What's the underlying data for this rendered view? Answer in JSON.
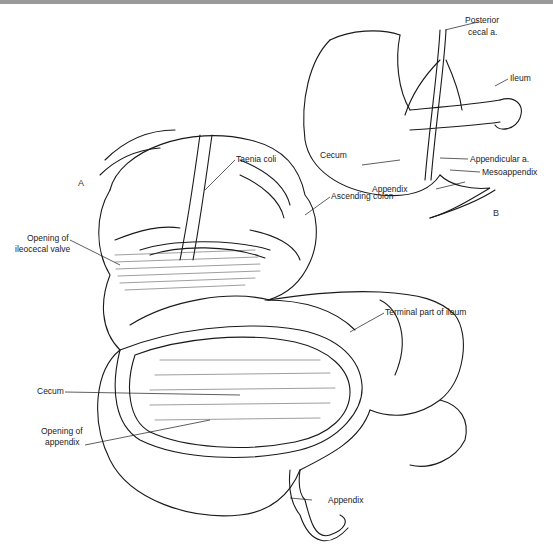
{
  "figure": {
    "panels": [
      {
        "id": "A",
        "label": "A"
      },
      {
        "id": "B",
        "label": "B"
      }
    ],
    "panel_a_labels": {
      "taenia_coli": "Taenia coli",
      "ascending_colon": "Ascending colon",
      "opening_ileocecal_line1": "Opening of",
      "opening_ileocecal_line2": "ileocecal valve",
      "terminal_ileum": "Terminal part of ileum",
      "cecum": "Cecum",
      "opening_appendix_line1": "Opening of",
      "opening_appendix_line2": "appendix",
      "appendix": "Appendix"
    },
    "panel_b_labels": {
      "posterior_cecal_line1": "Posterior",
      "posterior_cecal_line2": "cecal a.",
      "ileum": "Ileum",
      "cecum": "Cecum",
      "appendicular_a": "Appendicular a.",
      "mesoappendix": "Mesoappendix",
      "appendix": "Appendix"
    }
  }
}
